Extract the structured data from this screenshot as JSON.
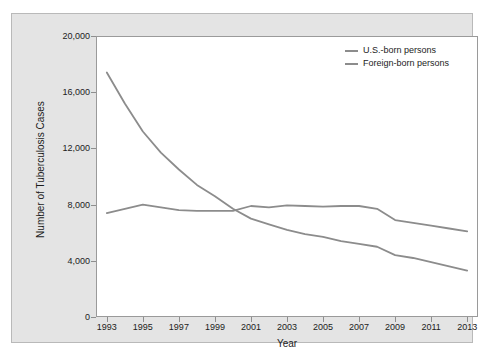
{
  "chart_data": {
    "type": "line",
    "title": "",
    "xlabel": "Year",
    "ylabel": "Number of Tuberculosis Cases",
    "xlim": [
      1992.4,
      2013.6
    ],
    "ylim": [
      0,
      20000
    ],
    "grid": false,
    "legend_position": "top-right",
    "x": [
      1993,
      1994,
      1995,
      1996,
      1997,
      1998,
      1999,
      2000,
      2001,
      2002,
      2003,
      2004,
      2005,
      2006,
      2007,
      2008,
      2009,
      2010,
      2011,
      2012,
      2013
    ],
    "xticks": [
      1993,
      1995,
      1997,
      1999,
      2001,
      2003,
      2005,
      2007,
      2009,
      2011,
      2013
    ],
    "xtick_labels": [
      "1993",
      "1995",
      "1997",
      "1999",
      "2001",
      "2003",
      "2005",
      "2007",
      "2009",
      "2011",
      "2013"
    ],
    "yticks": [
      0,
      4000,
      8000,
      12000,
      16000,
      20000
    ],
    "ytick_labels": [
      "0",
      "4,000",
      "8,000",
      "12,000",
      "16,000",
      "20,000"
    ],
    "series": [
      {
        "name": "U.S.-born persons",
        "color": "#8c8c8c",
        "values": [
          17400,
          15200,
          13200,
          11700,
          10500,
          9400,
          8600,
          7700,
          7000,
          6600,
          6200,
          5900,
          5700,
          5400,
          5200,
          5000,
          4400,
          4200,
          3900,
          3600,
          3300
        ]
      },
      {
        "name": "Foreign-born persons",
        "color": "#8c8c8c",
        "values": [
          7400,
          7700,
          8000,
          7800,
          7600,
          7550,
          7550,
          7550,
          7900,
          7800,
          7950,
          7900,
          7850,
          7900,
          7900,
          7700,
          6900,
          6700,
          6500,
          6300,
          6100
        ]
      }
    ]
  },
  "legend": {
    "items": [
      {
        "label": "U.S.-born persons"
      },
      {
        "label": "Foreign-born persons"
      }
    ]
  },
  "axes": {
    "x_title": "Year",
    "y_title": "Number of Tuberculosis Cases"
  },
  "colors": {
    "panel_background": "#e4e4e4",
    "plot_background": "#ffffff",
    "line": "#8c8c8c",
    "axis": "#9a9a9a",
    "text": "#1c1c1c"
  }
}
